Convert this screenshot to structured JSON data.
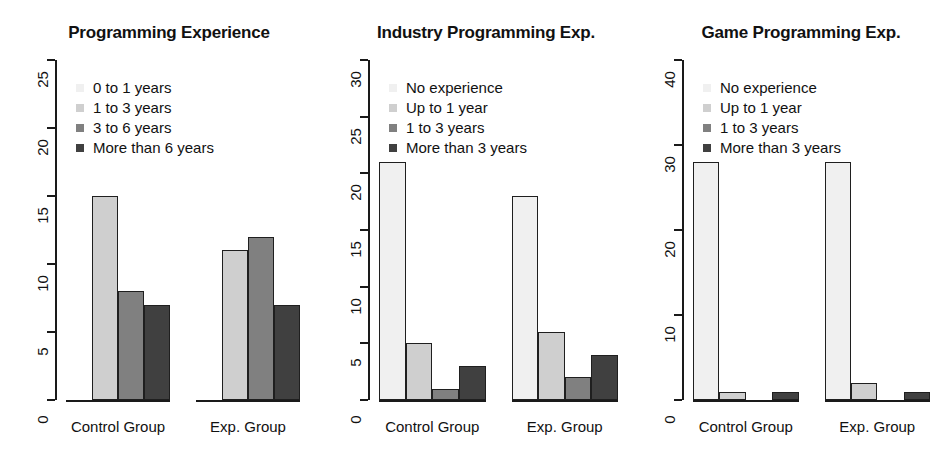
{
  "figure": {
    "width": 940,
    "height": 464,
    "background": "#ffffff"
  },
  "palette": {
    "series": [
      "#f0f0f0",
      "#cfcfcf",
      "#808080",
      "#404040"
    ],
    "axis": "#1a1a1a",
    "text": "#111111"
  },
  "chart_data": [
    {
      "type": "bar",
      "title": "Programming Experience",
      "xlabel": "",
      "ylabel": "",
      "ylim": [
        0,
        25
      ],
      "yticks": [
        0,
        5,
        10,
        15,
        20,
        25
      ],
      "ytick_labels": [
        "0",
        "5",
        "10",
        "15",
        "20",
        "25"
      ],
      "grid": false,
      "legend_position": "top-left",
      "categories": [
        "Control Group",
        "Exp. Group"
      ],
      "series": [
        {
          "name": "0 to 1 years",
          "color": "#f0f0f0",
          "values": [
            0,
            0
          ]
        },
        {
          "name": "1 to 3 years",
          "color": "#cfcfcf",
          "values": [
            15,
            11
          ]
        },
        {
          "name": "3 to 6 years",
          "color": "#808080",
          "values": [
            8,
            12
          ]
        },
        {
          "name": "More than 6 years",
          "color": "#404040",
          "values": [
            7,
            7
          ]
        }
      ]
    },
    {
      "type": "bar",
      "title": "Industry Programming Exp.",
      "xlabel": "",
      "ylabel": "",
      "ylim": [
        0,
        30
      ],
      "yticks": [
        0,
        5,
        10,
        15,
        20,
        25,
        30
      ],
      "ytick_labels": [
        "0",
        "5",
        "10",
        "15",
        "20",
        "25",
        "30"
      ],
      "grid": false,
      "legend_position": "top-left",
      "categories": [
        "Control Group",
        "Exp. Group"
      ],
      "series": [
        {
          "name": "No experience",
          "color": "#f0f0f0",
          "values": [
            21,
            18
          ]
        },
        {
          "name": "Up to 1 year",
          "color": "#cfcfcf",
          "values": [
            5,
            6
          ]
        },
        {
          "name": "1 to 3 years",
          "color": "#808080",
          "values": [
            1,
            2
          ]
        },
        {
          "name": "More than 3 years",
          "color": "#404040",
          "values": [
            3,
            4
          ]
        }
      ]
    },
    {
      "type": "bar",
      "title": "Game Programming Exp.",
      "xlabel": "",
      "ylabel": "",
      "ylim": [
        0,
        40
      ],
      "yticks": [
        0,
        10,
        20,
        30,
        40
      ],
      "ytick_labels": [
        "0",
        "10",
        "20",
        "30",
        "40"
      ],
      "grid": false,
      "legend_position": "top-left",
      "categories": [
        "Control Group",
        "Exp. Group"
      ],
      "series": [
        {
          "name": "No experience",
          "color": "#f0f0f0",
          "values": [
            28,
            28
          ]
        },
        {
          "name": "Up to 1 year",
          "color": "#cfcfcf",
          "values": [
            1,
            2
          ]
        },
        {
          "name": "1 to 3 years",
          "color": "#808080",
          "values": [
            0,
            0
          ]
        },
        {
          "name": "More than 3 years",
          "color": "#404040",
          "values": [
            1,
            1
          ]
        }
      ]
    }
  ]
}
